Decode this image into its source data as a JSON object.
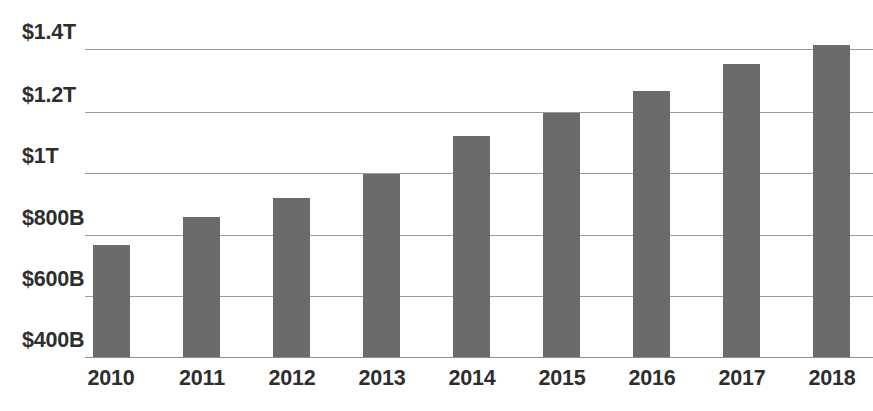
{
  "chart_data": {
    "type": "bar",
    "title": "",
    "subtitle": "",
    "xlabel": "",
    "ylabel": "",
    "categories": [
      "2010",
      "2011",
      "2012",
      "2013",
      "2014",
      "2015",
      "2016",
      "2017",
      "2018"
    ],
    "values": [
      765,
      855,
      915,
      995,
      1120,
      1190,
      1260,
      1350,
      1410
    ],
    "value_unit": "billions of US dollars",
    "series": [
      {
        "name": "",
        "values": [
          765,
          855,
          915,
          995,
          1120,
          1190,
          1260,
          1350,
          1410
        ]
      }
    ],
    "ytick_labels": [
      "$1.4T",
      "$1.2T",
      "$1T",
      "$800B",
      "$600B",
      "$400B"
    ],
    "ytick_values": [
      1400,
      1200,
      1000,
      800,
      600,
      400
    ],
    "ylim": [
      280,
      1400
    ],
    "grid": true,
    "legend": false,
    "legend_position": "none",
    "bar_color": "#6b6b6b",
    "grid_color": "#9b9b9b",
    "text_color": "#2e2e2e",
    "background_color": "#ffffff"
  },
  "axis": {
    "y_ticks": [
      {
        "label": "$1.4T",
        "y": 49,
        "label_y": 22
      },
      {
        "label": "$1.2T",
        "y": 112,
        "label_y": 85
      },
      {
        "label": "$1T",
        "y": 173,
        "label_y": 146
      },
      {
        "label": "$800B",
        "y": 235,
        "label_y": 208
      },
      {
        "label": "$600B",
        "y": 296,
        "label_y": 269
      },
      {
        "label": "$400B",
        "y": 357,
        "label_y": 330
      }
    ],
    "x_ticks": [
      {
        "label": "2010",
        "cx": 111
      },
      {
        "label": "2011",
        "cx": 202
      },
      {
        "label": "2012",
        "cx": 292
      },
      {
        "label": "2013",
        "cx": 382
      },
      {
        "label": "2014",
        "cx": 472
      },
      {
        "label": "2015",
        "cx": 562
      },
      {
        "label": "2016",
        "cx": 652
      },
      {
        "label": "2017",
        "cx": 742
      },
      {
        "label": "2018",
        "cx": 832
      }
    ]
  },
  "bars": [
    {
      "category": "2010",
      "value": 765,
      "x": 93,
      "width": 37,
      "top": 245,
      "bottom": 357
    },
    {
      "category": "2011",
      "value": 855,
      "x": 183,
      "width": 37,
      "top": 217,
      "bottom": 357
    },
    {
      "category": "2012",
      "value": 915,
      "x": 273,
      "width": 37,
      "top": 198,
      "bottom": 357
    },
    {
      "category": "2013",
      "value": 995,
      "x": 363,
      "width": 37,
      "top": 174,
      "bottom": 357
    },
    {
      "category": "2014",
      "value": 1120,
      "x": 453,
      "width": 37,
      "top": 136,
      "bottom": 357
    },
    {
      "category": "2015",
      "value": 1190,
      "x": 543,
      "width": 37,
      "top": 113,
      "bottom": 357
    },
    {
      "category": "2016",
      "value": 1260,
      "x": 633,
      "width": 37,
      "top": 91,
      "bottom": 357
    },
    {
      "category": "2017",
      "value": 1350,
      "x": 723,
      "width": 37,
      "top": 64,
      "bottom": 357
    },
    {
      "category": "2018",
      "value": 1410,
      "x": 813,
      "width": 37,
      "top": 45,
      "bottom": 357
    }
  ],
  "gridlines": [
    {
      "y": 49,
      "left": 85,
      "width": 788
    },
    {
      "y": 112,
      "left": 85,
      "width": 788
    },
    {
      "y": 173,
      "left": 85,
      "width": 788
    },
    {
      "y": 235,
      "left": 85,
      "width": 788
    },
    {
      "y": 296,
      "left": 85,
      "width": 788
    },
    {
      "y": 357,
      "left": 85,
      "width": 788
    }
  ],
  "ylabel_left": 22
}
